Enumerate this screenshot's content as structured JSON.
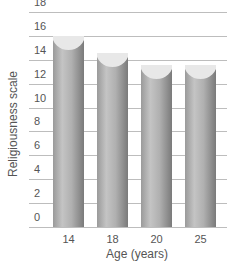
{
  "chart_data": {
    "type": "bar",
    "title": "",
    "xlabel": "Age (years)",
    "ylabel": "Religiousness scale",
    "categories": [
      "14",
      "18",
      "20",
      "25"
    ],
    "values": [
      16.0,
      14.6,
      13.6,
      13.6
    ],
    "ylim": [
      0,
      18
    ],
    "yticks": [
      0,
      2,
      4,
      6,
      8,
      10,
      12,
      14,
      16,
      18
    ],
    "grid": true,
    "legend": null,
    "bar_color": "#a8a8a8"
  }
}
